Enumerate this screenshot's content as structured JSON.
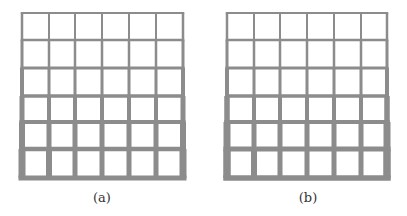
{
  "colors": {
    "member": "#8c8c8c",
    "background": "#ffffff",
    "caption": "#333333"
  },
  "figures": [
    {
      "id": "a",
      "caption": "(a)",
      "cols_x": [
        22,
        49,
        75,
        102,
        129,
        156,
        183
      ],
      "rows_y": [
        13,
        40,
        68,
        96,
        122,
        149,
        178
      ],
      "column_widths_by_story": [
        [
          6,
          5,
          5,
          5,
          5,
          6
        ],
        [
          5,
          5,
          5,
          5,
          5,
          5
        ],
        [
          4,
          4,
          4,
          4,
          4,
          4
        ],
        [
          3,
          3,
          3,
          3,
          3,
          3
        ],
        [
          2.5,
          2.5,
          2.5,
          2.5,
          2.5,
          2.5
        ],
        [
          2,
          2,
          2,
          2,
          2,
          2
        ]
      ],
      "column_outer_widths_by_story": [
        7,
        6,
        5,
        4,
        3,
        2.5
      ],
      "beam_widths_by_level": [
        5,
        4.5,
        4,
        3.5,
        3,
        2.5,
        2
      ]
    },
    {
      "id": "b",
      "caption": "(b)",
      "cols_x": [
        23,
        50,
        76,
        103,
        130,
        157,
        183
      ],
      "rows_y": [
        13,
        40,
        68,
        96,
        122,
        149,
        178
      ],
      "column_widths_by_story": [
        [
          6,
          5,
          5,
          5,
          5,
          6
        ],
        [
          5,
          5,
          5,
          5,
          5,
          5
        ],
        [
          4,
          4,
          4,
          4,
          4,
          4
        ],
        [
          3,
          3,
          3,
          3,
          3,
          3
        ],
        [
          2.5,
          2.5,
          2.5,
          2.5,
          2.5,
          2.5
        ],
        [
          2,
          2,
          2,
          2,
          2,
          2
        ]
      ],
      "column_outer_widths_by_story": [
        7.5,
        7,
        5.5,
        4,
        3,
        2.5
      ],
      "beam_widths_by_level": [
        5.5,
        5,
        4,
        3.5,
        3,
        2.5,
        2
      ]
    }
  ]
}
